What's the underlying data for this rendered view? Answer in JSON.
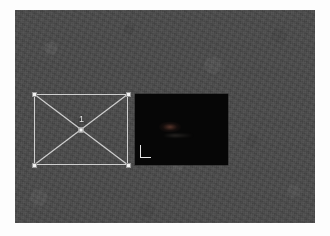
{
  "app": {
    "window_title": "3D Viewport",
    "background_color": "#4b4b4b",
    "canvas_border_color": "#fdfdfd"
  },
  "viewport": {
    "name": "perspective-viewport",
    "background_color": "#4b4b4b",
    "texture": "noise"
  },
  "selection": {
    "name": "selection-bounding-box",
    "object_label": "1",
    "line_color": "#cfcfcf",
    "handle_color": "#f2f2f2",
    "handles": [
      {
        "position": "top-left"
      },
      {
        "position": "top-right"
      },
      {
        "position": "bottom-left"
      },
      {
        "position": "bottom-right"
      },
      {
        "position": "center"
      }
    ],
    "diagonals": [
      {
        "from": "top-left",
        "to": "bottom-right"
      },
      {
        "from": "bottom-left",
        "to": "top-right"
      }
    ]
  },
  "render_panel": {
    "name": "render-preview-panel",
    "background_color": "#060606",
    "axis_gizmo": {
      "name": "axis-indicator",
      "shape": "L",
      "color": "#e6e6e6",
      "vertical_axis_label": "",
      "horizontal_axis_label": ""
    }
  }
}
